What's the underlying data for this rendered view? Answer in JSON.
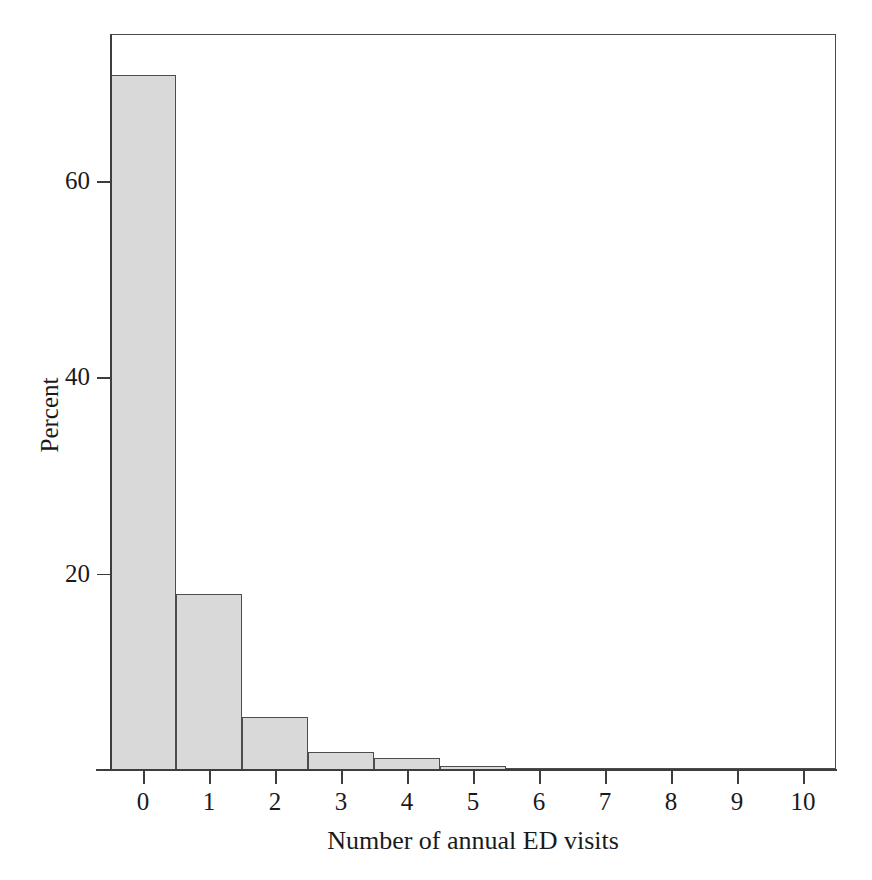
{
  "chart_data": {
    "type": "bar",
    "title": "",
    "subtitle": "",
    "xlabel": "Number of annual ED visits",
    "ylabel": "Percent",
    "categories": [
      "0",
      "1",
      "2",
      "3",
      "4",
      "5",
      "6",
      "7",
      "8",
      "9",
      "10"
    ],
    "values": [
      70.8,
      17.9,
      5.4,
      1.8,
      1.2,
      0.4,
      0.2,
      0.1,
      0.05,
      0.03,
      0.02
    ],
    "x": [
      0,
      1,
      2,
      3,
      4,
      5,
      6,
      7,
      8,
      9,
      10
    ],
    "xtick_labels": [
      "0",
      "1",
      "2",
      "3",
      "4",
      "5",
      "6",
      "7",
      "8",
      "9",
      "10"
    ],
    "ytick_labels": [
      "20",
      "40",
      "60"
    ],
    "ytick_values": [
      20,
      40,
      60
    ],
    "xlim": [
      -0.5,
      10.5
    ],
    "ylim": [
      0,
      75
    ],
    "grid": false,
    "legend": false,
    "legend_position": "none",
    "bar_fill_color": "#d9d9d9",
    "bar_edge_color": "#4d4d4d",
    "axis_color": "#3d3d3d",
    "text_color": "#1a1a1a",
    "background_color": "#ffffff",
    "bar_width_units": 1.0,
    "annotations": []
  },
  "figure": {
    "frame_visible": true,
    "axis_label_x": "Number of annual ED visits",
    "axis_label_y": "Percent"
  }
}
